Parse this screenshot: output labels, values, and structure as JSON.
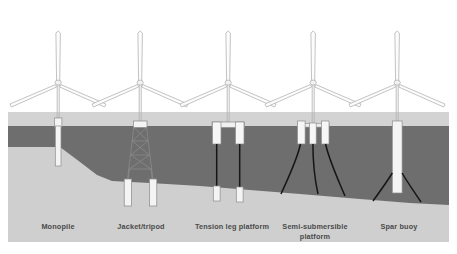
{
  "figure": {
    "canvas": {
      "width": 457,
      "height": 254
    }
  },
  "palette": {
    "page_background": "#ffffff",
    "panel_background": "#d3d3d3",
    "water": "#6e6e6e",
    "seabed": "#cfcfcf",
    "structure_fill": "#f4f4f4",
    "structure_stroke": "#8c8c8c",
    "turbine_stroke": "#b4b4b4",
    "mooring_line": "#161616",
    "label_text": "#4a4a4a"
  },
  "scene": {
    "water_surface_y": 126,
    "panel_top_y": 112,
    "panel_bottom_y": 242,
    "seabed_profile": [
      {
        "x": 0,
        "y": 147
      },
      {
        "x": 60,
        "y": 147
      },
      {
        "x": 80,
        "y": 162
      },
      {
        "x": 97,
        "y": 175
      },
      {
        "x": 112,
        "y": 181
      },
      {
        "x": 150,
        "y": 183
      },
      {
        "x": 200,
        "y": 186
      },
      {
        "x": 250,
        "y": 190
      },
      {
        "x": 300,
        "y": 194
      },
      {
        "x": 360,
        "y": 199
      },
      {
        "x": 410,
        "y": 203
      },
      {
        "x": 457,
        "y": 205
      }
    ]
  },
  "turbines": [
    {
      "name": "turbine-monopile",
      "hub_x": 58,
      "hub_y": 82,
      "tower_base_y": 126,
      "rotor_radius": 49
    },
    {
      "name": "turbine-jacket",
      "hub_x": 140,
      "hub_y": 82,
      "tower_base_y": 122,
      "rotor_radius": 49
    },
    {
      "name": "turbine-tension-leg",
      "hub_x": 228,
      "hub_y": 82,
      "tower_base_y": 124,
      "rotor_radius": 49
    },
    {
      "name": "turbine-semi-submersible",
      "hub_x": 313,
      "hub_y": 82,
      "tower_base_y": 124,
      "rotor_radius": 49
    },
    {
      "name": "turbine-spar-buoy",
      "hub_x": 397,
      "hub_y": 82,
      "tower_base_y": 126,
      "rotor_radius": 49
    }
  ],
  "substructures": [
    {
      "id": "monopile",
      "label": "Monopile",
      "label_x": 58,
      "type": "fixed-bottom",
      "description": "Single large-diameter pile driven into the seabed"
    },
    {
      "id": "jacket-tripod",
      "label": "Jacket/tripod",
      "label_x": 141,
      "type": "fixed-bottom",
      "description": "Braced steel lattice frame on piled legs",
      "lattice_bays": 4
    },
    {
      "id": "tension-leg-platform",
      "label": "Tension leg platform",
      "label_x": 232,
      "type": "floating",
      "description": "Buoyant hull held down by vertical taut tendons to seabed anchors",
      "tendons": 2
    },
    {
      "id": "semi-submersible-platform",
      "label": "Semi-submersible\nplatform",
      "label_line1": "Semi-submersible",
      "label_line2": "platform",
      "label_x": 315,
      "type": "floating",
      "description": "Multi-column buoyant hull held by catenary mooring lines",
      "columns": 3,
      "mooring_lines": 3
    },
    {
      "id": "spar-buoy",
      "label": "Spar buoy",
      "label_x": 399,
      "type": "floating",
      "description": "Deep ballasted vertical cylinder with catenary moorings",
      "mooring_lines": 2
    }
  ]
}
